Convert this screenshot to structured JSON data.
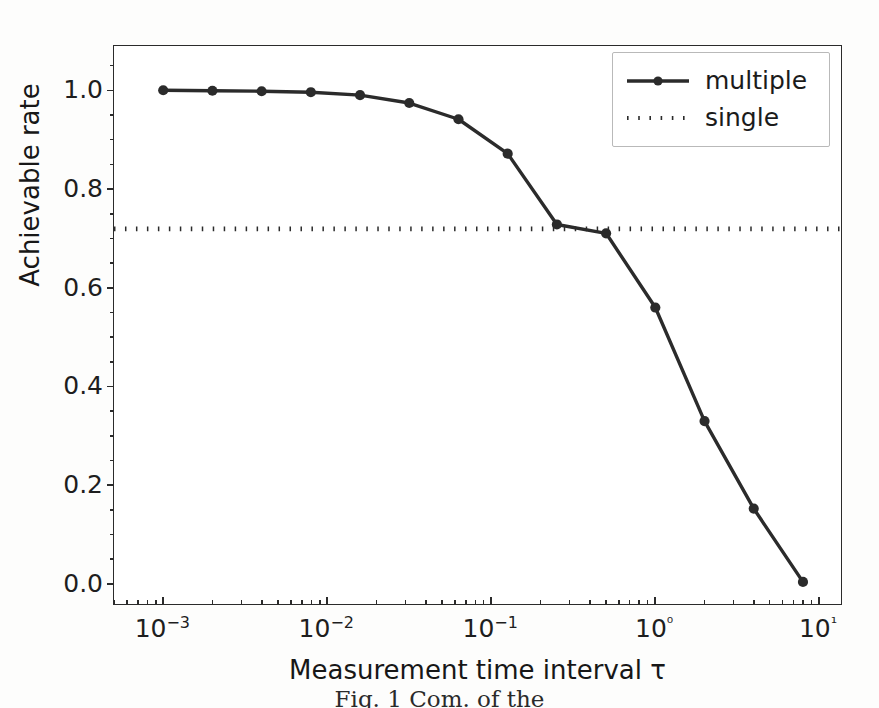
{
  "chart_data": {
    "type": "line",
    "title": "",
    "xlabel": "Measurement time interval τ",
    "ylabel": "Achievable rate",
    "xscale": "log",
    "xlim": [
      0.0005,
      14.0
    ],
    "ylim": [
      -0.045,
      1.09
    ],
    "grid": false,
    "legend_position": "upper right",
    "x_tick_labels": [
      "10−3",
      "10−2",
      "10−1",
      "10⁰",
      "10¹"
    ],
    "x_tick_values": [
      0.001,
      0.01,
      0.1,
      1,
      10
    ],
    "y_tick_labels": [
      "0.0",
      "0.2",
      "0.4",
      "0.6",
      "0.8",
      "1.0"
    ],
    "y_tick_values": [
      0.0,
      0.2,
      0.4,
      0.6,
      0.8,
      1.0
    ],
    "series": [
      {
        "name": "multiple",
        "style": "solid-with-markers",
        "color": "#2b2b2b",
        "marker": "circle",
        "x": [
          0.001,
          0.002,
          0.004,
          0.008,
          0.016,
          0.032,
          0.064,
          0.128,
          0.256,
          0.512,
          1.024,
          2.048,
          4.096,
          8.192
        ],
        "y": [
          1.0,
          0.999,
          0.998,
          0.996,
          0.99,
          0.974,
          0.941,
          0.871,
          0.727,
          0.709,
          0.558,
          0.327,
          0.149,
          0.0
        ]
      },
      {
        "name": "single",
        "style": "dotted",
        "color": "#2b2b2b",
        "constant_value": 0.718,
        "x": [
          0.0005,
          14.0
        ],
        "y": [
          0.718,
          0.718
        ]
      }
    ]
  },
  "legend": {
    "items": [
      {
        "label": "multiple",
        "style": "solid-with-markers"
      },
      {
        "label": "single",
        "style": "dotted"
      }
    ]
  },
  "axes": {
    "x_title": "Measurement time interval τ",
    "y_title": "Achievable rate"
  },
  "caption": {
    "text": "Fig. 1  Com. of the"
  }
}
